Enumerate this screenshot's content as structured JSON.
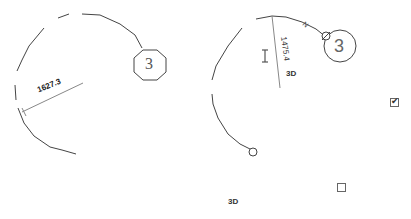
{
  "left_diagram": {
    "dimension_label": "1627.3",
    "grid_bubble_label": "3"
  },
  "right_diagram": {
    "dimension_label": "1475.4",
    "grid_bubble_label": "3",
    "arc_tag": "N",
    "view_label": "3D"
  },
  "bottom_view_label": "3D",
  "checkboxes": [
    {
      "checked": true,
      "glyph": "✔"
    },
    {
      "checked": false,
      "glyph": ""
    }
  ],
  "colors": {
    "line": "#444444",
    "dimension_line": "#888888"
  }
}
